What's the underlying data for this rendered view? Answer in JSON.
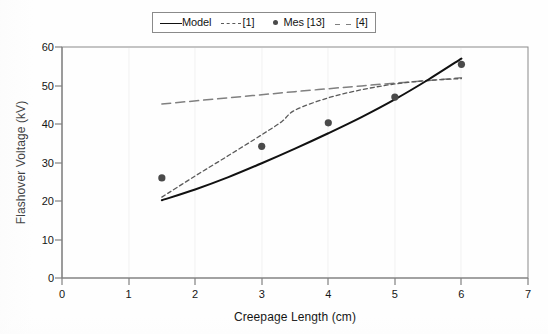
{
  "chart_data": {
    "type": "line",
    "title": "",
    "xlabel": "Creepage Length (cm)",
    "ylabel": "Flashover Voltage (kV)",
    "xlim": [
      0,
      7
    ],
    "ylim": [
      0,
      60
    ],
    "xticks": [
      0,
      1,
      2,
      3,
      4,
      5,
      6,
      7
    ],
    "yticks": [
      0,
      10,
      20,
      30,
      40,
      50,
      60
    ],
    "xtick_labels": [
      "0",
      "1",
      "2",
      "3",
      "4",
      "5",
      "6",
      "7"
    ],
    "ytick_labels": [
      "0",
      "10",
      "20",
      "30",
      "40",
      "50",
      "60"
    ],
    "grid": false,
    "legend_position": "top-center",
    "legend_entries": [
      {
        "label": "Model",
        "style": "solid",
        "color": "#111111"
      },
      {
        "label": "[1]",
        "style": "dashed",
        "color": "#5a5a5a"
      },
      {
        "label": "Mes [13]",
        "style": "marker",
        "color": "#4a4a4a"
      },
      {
        "label": "[4]",
        "style": "longdash",
        "color": "#808080"
      }
    ],
    "series": [
      {
        "name": "Model",
        "style": "solid",
        "color": "#111111",
        "x": [
          1.5,
          2.0,
          2.5,
          3.0,
          3.5,
          4.0,
          4.5,
          5.0,
          5.5,
          6.0
        ],
        "values": [
          20.2,
          23.0,
          26.2,
          29.8,
          33.6,
          37.6,
          41.8,
          46.4,
          51.5,
          57.0
        ]
      },
      {
        "name": "[1]",
        "style": "dashed",
        "color": "#5a5a5a",
        "x": [
          1.5,
          2.0,
          2.5,
          3.0,
          3.3,
          3.5,
          4.0,
          4.5,
          5.0,
          5.5,
          6.0
        ],
        "values": [
          21.0,
          26.5,
          31.8,
          37.2,
          40.6,
          43.6,
          46.8,
          48.9,
          50.4,
          51.3,
          51.8
        ]
      },
      {
        "name": "[4]",
        "style": "longdash",
        "color": "#808080",
        "x": [
          1.5,
          2.5,
          3.5,
          4.5,
          5.0,
          5.5,
          6.0
        ],
        "values": [
          45.2,
          46.8,
          48.4,
          49.9,
          50.6,
          51.3,
          52.0
        ]
      },
      {
        "name": "Mes [13]",
        "style": "scatter",
        "color": "#4a4a4a",
        "x": [
          1.5,
          3.0,
          4.0,
          5.0,
          6.0
        ],
        "values": [
          26.0,
          34.2,
          40.3,
          47.0,
          55.5
        ]
      }
    ]
  },
  "legend": {
    "model_label": "Model",
    "ref1_label": "[1]",
    "mes_label": "Mes [13]",
    "ref4_label": "[4]"
  },
  "axes": {
    "x_title": "Creepage Length (cm)",
    "y_title": "Flashover Voltage (kV)"
  },
  "colors": {
    "model_line": "#111111",
    "ref1_line": "#5a5a5a",
    "ref4_line": "#808080",
    "marker": "#4a4a4a",
    "axis": "#808080",
    "frame": "#8a8a8a"
  }
}
